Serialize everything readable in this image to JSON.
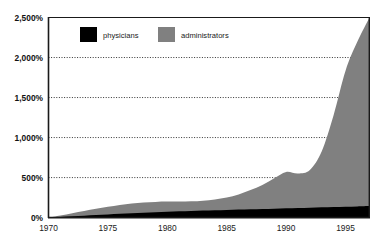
{
  "chart_data": {
    "type": "area",
    "title": "",
    "subtitle": "",
    "xlabel": "",
    "ylabel": "",
    "stacked": true,
    "grid": true,
    "grid_style": "dotted-horizontal",
    "legend_position": "top-center-inside",
    "xlim": [
      1970,
      1997
    ],
    "ylim": [
      0,
      2500
    ],
    "x_tick_labels": [
      "1970",
      "1975",
      "1980",
      "1985",
      "1990",
      "1995"
    ],
    "x_tick_values": [
      1970,
      1975,
      1980,
      1985,
      1990,
      1995
    ],
    "y_tick_labels": [
      "0%",
      "500%",
      "1,000%",
      "1,500%",
      "2,000%",
      "2,500%"
    ],
    "y_tick_values": [
      0,
      500,
      1000,
      1500,
      2000,
      2500
    ],
    "gridline_values": [
      500,
      1000,
      1500,
      2000
    ],
    "colors": {
      "physicians": "#000000",
      "administrators": "#808080",
      "axis": "#1a1a1a",
      "grid": "#333333",
      "background": "#ffffff"
    },
    "x": [
      1970,
      1971,
      1972,
      1973,
      1974,
      1975,
      1976,
      1977,
      1978,
      1979,
      1980,
      1981,
      1982,
      1983,
      1984,
      1985,
      1986,
      1987,
      1988,
      1989,
      1990,
      1991,
      1992,
      1993,
      1994,
      1995,
      1996,
      1997
    ],
    "series": [
      {
        "name": "physicians",
        "color": "#000000",
        "values": [
          0,
          8,
          16,
          24,
          32,
          40,
          48,
          55,
          62,
          68,
          74,
          79,
          84,
          88,
          92,
          96,
          100,
          104,
          108,
          112,
          116,
          120,
          124,
          128,
          132,
          136,
          140,
          144
        ]
      },
      {
        "name": "administrators",
        "color": "#808080",
        "values": [
          0,
          18,
          38,
          58,
          78,
          95,
          110,
          120,
          126,
          128,
          126,
          122,
          120,
          124,
          135,
          155,
          190,
          240,
          300,
          380,
          455,
          430,
          470,
          700,
          1150,
          1700,
          2060,
          2350
        ]
      }
    ]
  },
  "legend": {
    "items": [
      {
        "label": "physicians",
        "swatch_color": "#000000"
      },
      {
        "label": "administrators",
        "swatch_color": "#808080"
      }
    ]
  },
  "axes": {
    "y": {
      "ticks": [
        {
          "label": "2,500%",
          "value": 2500
        },
        {
          "label": "2,000%",
          "value": 2000
        },
        {
          "label": "1,500%",
          "value": 1500
        },
        {
          "label": "1,000%",
          "value": 1000
        },
        {
          "label": "500%",
          "value": 500
        },
        {
          "label": "0%",
          "value": 0
        }
      ]
    },
    "x": {
      "ticks": [
        {
          "label": "1970",
          "value": 1970
        },
        {
          "label": "1975",
          "value": 1975
        },
        {
          "label": "1980",
          "value": 1980
        },
        {
          "label": "1985",
          "value": 1985
        },
        {
          "label": "1990",
          "value": 1990
        },
        {
          "label": "1995",
          "value": 1995
        }
      ]
    }
  }
}
